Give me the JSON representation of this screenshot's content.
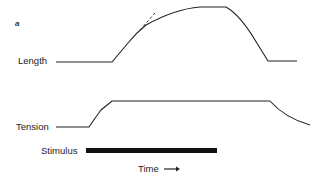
{
  "figure": {
    "panel_label": "a",
    "traces": [
      {
        "name": "Length",
        "label": "Length"
      },
      {
        "name": "Tension",
        "label": "Tension"
      }
    ],
    "stimulus": {
      "label": "Stimulus"
    },
    "x_axis": {
      "label": "Time",
      "arrow": "right-arrow"
    },
    "annotations": [
      "dashed tangent line at initial slope of length trace"
    ]
  },
  "colors": {
    "line": "#222222",
    "background": "#ffffff"
  }
}
